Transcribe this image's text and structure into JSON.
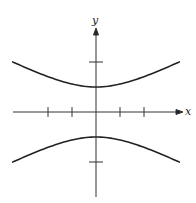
{
  "chart_data": {
    "type": "line",
    "title": "",
    "xlabel": "x",
    "ylabel": "y",
    "xlim": [
      -4,
      4
    ],
    "ylim": [
      -4,
      4
    ],
    "grid": false,
    "x_ticks": [
      -2,
      -1,
      1,
      2
    ],
    "y_ticks": [
      -2,
      2
    ],
    "tick_labels_shown": false,
    "series": [
      {
        "name": "upper branch",
        "x": [
          -3.5,
          -3,
          -2,
          -1,
          0,
          1,
          2,
          3,
          3.5
        ],
        "y": [
          2.02,
          1.8,
          1.41,
          1.12,
          1.0,
          1.12,
          1.41,
          1.8,
          2.02
        ]
      },
      {
        "name": "lower branch",
        "x": [
          -3.5,
          -3,
          -2,
          -1,
          0,
          1,
          2,
          3,
          3.5
        ],
        "y": [
          -2.02,
          -1.8,
          -1.41,
          -1.12,
          -1.0,
          -1.12,
          -1.41,
          -1.8,
          -2.02
        ]
      }
    ],
    "colors": {
      "axes": "#333333",
      "curve": "#222222"
    }
  },
  "labels": {
    "x_axis": "x",
    "y_axis": "y"
  }
}
